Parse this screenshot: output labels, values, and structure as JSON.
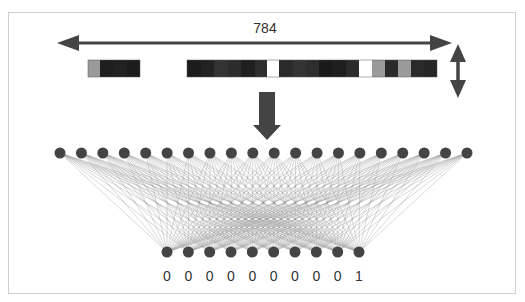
{
  "diagram": {
    "width_label": "784",
    "colors": {
      "arrow": "#444444",
      "node": "#444444",
      "edge": "#8a8a8a",
      "frame": "#cfcfcf",
      "label": "#333333"
    },
    "input_strip": {
      "segments": [
        {
          "x": 88,
          "y": 60,
          "h": 17,
          "cells": [
            {
              "w": 12,
              "color": "#9a9a9a"
            },
            {
              "w": 13,
              "color": "#1e1e1e"
            },
            {
              "w": 14,
              "color": "#222222"
            },
            {
              "w": 13,
              "color": "#1c1c1c"
            }
          ]
        },
        {
          "x": 187,
          "y": 60,
          "h": 17,
          "cells": [
            {
              "w": 14,
              "color": "#1c1c1c"
            },
            {
              "w": 13,
              "color": "#222222"
            },
            {
              "w": 14,
              "color": "#333333"
            },
            {
              "w": 13,
              "color": "#2c2c2c"
            },
            {
              "w": 14,
              "color": "#1f1f1f"
            },
            {
              "w": 12,
              "color": "#2e2e2e"
            },
            {
              "w": 12,
              "color": "#ffffff"
            },
            {
              "w": 14,
              "color": "#2a2a2a"
            },
            {
              "w": 13,
              "color": "#333333"
            },
            {
              "w": 13,
              "color": "#2e2e2e"
            },
            {
              "w": 13,
              "color": "#1a1a1a"
            },
            {
              "w": 14,
              "color": "#1e1e1e"
            },
            {
              "w": 13,
              "color": "#2b2b2b"
            },
            {
              "w": 13,
              "color": "#ffffff"
            },
            {
              "w": 13,
              "color": "#9a9a9a"
            },
            {
              "w": 13,
              "color": "#2a2a2a"
            },
            {
              "w": 13,
              "color": "#9a9a9a"
            },
            {
              "w": 13,
              "color": "#2a2a2a"
            },
            {
              "w": 13,
              "color": "#262626"
            }
          ]
        }
      ]
    },
    "input_layer": {
      "count": 20,
      "y": 153,
      "x_start": 60,
      "x_end": 467,
      "radius": 5.5
    },
    "output_layer": {
      "count": 10,
      "y": 252,
      "x_start": 167,
      "x_end": 359,
      "radius": 5.5,
      "labels": [
        "0",
        "0",
        "0",
        "0",
        "0",
        "0",
        "0",
        "0",
        "0",
        "1"
      ],
      "label_y": 281
    },
    "arrows": {
      "horizontal": {
        "x1": 57,
        "x2": 452,
        "y": 43,
        "label_x": 265,
        "label_y": 33
      },
      "vertical": {
        "x": 458,
        "y1": 44,
        "y2": 98
      },
      "down": {
        "x": 267,
        "y1": 92,
        "y2": 140
      }
    }
  }
}
